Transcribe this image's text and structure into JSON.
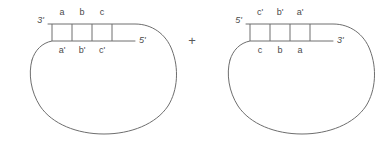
{
  "figure": {
    "background_color": "#ffffff",
    "stroke_color": "#6e6e6e",
    "text_color": "#4a4a4a",
    "operator": "+",
    "molecules": [
      {
        "name": "left-circular-strand",
        "top_strand": {
          "end_label": "3'",
          "end_label_side": "left",
          "segments": [
            "a",
            "b",
            "c"
          ]
        },
        "bottom_strand": {
          "end_label": "5'",
          "end_label_side": "right",
          "segments": [
            "a'",
            "b'",
            "c'"
          ]
        }
      },
      {
        "name": "right-circular-strand",
        "top_strand": {
          "end_label": "5'",
          "end_label_side": "left",
          "segments": [
            "c'",
            "b'",
            "a'"
          ]
        },
        "bottom_strand": {
          "end_label": "3'",
          "end_label_side": "right",
          "segments": [
            "c",
            "b",
            "a"
          ]
        }
      }
    ]
  }
}
